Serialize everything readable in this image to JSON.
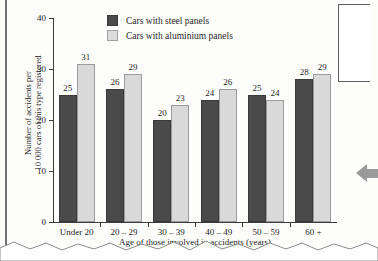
{
  "chart_data": {
    "type": "bar",
    "title": "",
    "xlabel": "Age of those involved in accidents (years)",
    "ylabel": "Number of accidents per 10 000 cars of this type registered",
    "ylabel_line1": "Number of accidents per",
    "ylabel_line2": "10 000 cars of this type registered",
    "categories": [
      "Under 20",
      "20 – 29",
      "30 – 39",
      "40 – 49",
      "50 – 59",
      "60 +"
    ],
    "series": [
      {
        "name": "Cars with steel panels",
        "color": "#4a4a4a",
        "values": [
          25,
          26,
          20,
          24,
          25,
          28
        ]
      },
      {
        "name": "Cars with aluminium panels",
        "color": "#d9d9d9",
        "values": [
          31,
          29,
          23,
          26,
          24,
          29
        ]
      }
    ],
    "ylim": [
      0,
      40
    ],
    "yticks": [
      0,
      10,
      20,
      30,
      40
    ],
    "ytick_labels": [
      "0",
      "10",
      "20",
      "30",
      "40"
    ],
    "grid": false,
    "legend_position": "top-center",
    "data_labels": true
  },
  "legend": {
    "items": [
      {
        "label": "Cars with steel panels",
        "swatch": "steel"
      },
      {
        "label": "Cars with aluminium panels",
        "swatch": "alu"
      }
    ]
  },
  "page": {
    "background_color": "#fdfdfc",
    "axis_color": "#3b3b3b",
    "text_color": "#1d1d1d"
  }
}
